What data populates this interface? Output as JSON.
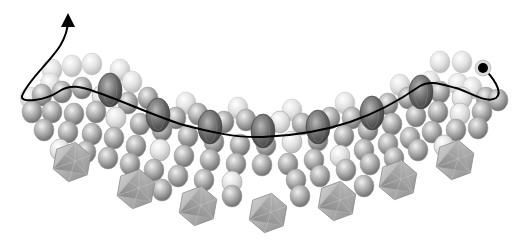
{
  "figure": {
    "width": 522,
    "height": 244,
    "background": "#ffffff"
  },
  "colors": {
    "sphere_light": "#e6e6e6",
    "sphere_mid": "#b4b4b4",
    "sphere_dark": "#8a8a8a",
    "ellipsoid": "#6e6e6e",
    "icosahedron": "#a8a8a8",
    "path": "#000000"
  },
  "spheres_back": [
    [
      52,
      70
    ],
    [
      72,
      66
    ],
    [
      92,
      64
    ],
    [
      440,
      62
    ],
    [
      462,
      62
    ],
    [
      186,
      103
    ],
    [
      238,
      108
    ],
    [
      292,
      110
    ],
    [
      345,
      103
    ],
    [
      400,
      85
    ],
    [
      50,
      84
    ],
    [
      30,
      98
    ],
    [
      458,
      84
    ],
    [
      472,
      88
    ],
    [
      120,
      70
    ],
    [
      132,
      82
    ],
    [
      430,
      82
    ]
  ],
  "spheres_mid": [
    [
      42,
      95
    ],
    [
      62,
      92
    ],
    [
      82,
      88
    ],
    [
      102,
      96
    ],
    [
      128,
      103
    ],
    [
      148,
      98
    ],
    [
      176,
      118
    ],
    [
      198,
      114
    ],
    [
      224,
      122
    ],
    [
      246,
      120
    ],
    [
      280,
      122
    ],
    [
      302,
      124
    ],
    [
      330,
      118
    ],
    [
      352,
      118
    ],
    [
      388,
      104
    ],
    [
      408,
      98
    ],
    [
      440,
      92
    ],
    [
      462,
      98
    ],
    [
      486,
      98
    ],
    [
      498,
      100
    ],
    [
      32,
      112
    ],
    [
      52,
      112
    ],
    [
      74,
      114
    ],
    [
      96,
      112
    ],
    [
      116,
      118
    ],
    [
      140,
      124
    ],
    [
      162,
      130
    ],
    [
      188,
      136
    ],
    [
      214,
      142
    ],
    [
      240,
      145
    ],
    [
      266,
      145
    ],
    [
      292,
      142
    ],
    [
      318,
      140
    ],
    [
      344,
      136
    ],
    [
      368,
      130
    ],
    [
      392,
      124
    ],
    [
      416,
      116
    ],
    [
      438,
      112
    ],
    [
      460,
      114
    ],
    [
      482,
      112
    ],
    [
      44,
      130
    ],
    [
      68,
      132
    ],
    [
      92,
      134
    ],
    [
      114,
      138
    ],
    [
      136,
      146
    ],
    [
      160,
      150
    ],
    [
      184,
      156
    ],
    [
      210,
      160
    ],
    [
      236,
      164
    ],
    [
      262,
      165
    ],
    [
      288,
      164
    ],
    [
      314,
      160
    ],
    [
      340,
      156
    ],
    [
      364,
      150
    ],
    [
      388,
      144
    ],
    [
      410,
      138
    ],
    [
      432,
      132
    ],
    [
      456,
      130
    ],
    [
      478,
      128
    ],
    [
      60,
      150
    ],
    [
      86,
      152
    ],
    [
      108,
      158
    ],
    [
      130,
      164
    ],
    [
      154,
      170
    ],
    [
      178,
      176
    ],
    [
      204,
      180
    ],
    [
      232,
      182
    ],
    [
      296,
      180
    ],
    [
      320,
      176
    ],
    [
      346,
      170
    ],
    [
      370,
      164
    ],
    [
      394,
      158
    ],
    [
      418,
      150
    ],
    [
      444,
      146
    ],
    [
      162,
      190
    ],
    [
      232,
      196
    ],
    [
      300,
      196
    ],
    [
      364,
      186
    ]
  ],
  "ellipsoids": [
    {
      "x": 110,
      "y": 90,
      "rx": 12,
      "ry": 17
    },
    {
      "x": 158,
      "y": 115,
      "rx": 12,
      "ry": 17
    },
    {
      "x": 210,
      "y": 127,
      "rx": 12,
      "ry": 17
    },
    {
      "x": 263,
      "y": 131,
      "rx": 12,
      "ry": 17
    },
    {
      "x": 318,
      "y": 127,
      "rx": 12,
      "ry": 17
    },
    {
      "x": 372,
      "y": 113,
      "rx": 12,
      "ry": 17
    },
    {
      "x": 421,
      "y": 92,
      "rx": 12,
      "ry": 17
    }
  ],
  "icosahedra": [
    {
      "x": 72,
      "y": 162,
      "r": 20
    },
    {
      "x": 136,
      "y": 189,
      "r": 20
    },
    {
      "x": 198,
      "y": 206,
      "r": 20
    },
    {
      "x": 268,
      "y": 213,
      "r": 20
    },
    {
      "x": 337,
      "y": 201,
      "r": 20
    },
    {
      "x": 398,
      "y": 180,
      "r": 20
    },
    {
      "x": 455,
      "y": 160,
      "r": 20
    }
  ],
  "path": {
    "start_marker": {
      "x": 483,
      "y": 68,
      "r": 5
    },
    "d": "M 483 68 C 492 76, 504 92, 496 98 C 486 104, 470 92, 456 88 C 440 84, 430 80, 420 86 C 400 100, 380 112, 350 122 C 320 132, 290 136, 263 137 C 236 138, 210 132, 180 124 C 150 114, 120 100, 96 92 C 80 86, 70 84, 58 92 C 46 100, 20 104, 22 96 C 28 80, 50 62, 60 46 C 66 36, 68 28, 68 20",
    "arrowhead": {
      "tip_x": 67,
      "tip_y": 12
    }
  }
}
